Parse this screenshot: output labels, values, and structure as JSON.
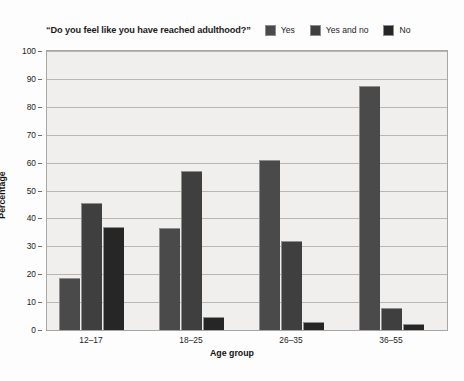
{
  "chart_data": {
    "type": "bar",
    "title": "“Do you feel like you have reached adulthood?”",
    "xlabel": "Age group",
    "ylabel": "Percentage",
    "categories": [
      "12–17",
      "18–25",
      "26–35",
      "36–55"
    ],
    "series": [
      {
        "name": "Yes",
        "values": [
          18.5,
          36.5,
          61,
          87.5
        ],
        "color": "#4a4a4a"
      },
      {
        "name": "Yes and no",
        "values": [
          45.5,
          57,
          32,
          8
        ],
        "color": "#3f3f3f"
      },
      {
        "name": "No",
        "values": [
          37,
          4.5,
          3,
          2
        ],
        "color": "#262626"
      }
    ],
    "ylim": [
      0,
      100
    ],
    "ytick_step": 10,
    "yticks": [
      "100",
      "90",
      "80",
      "70",
      "60",
      "50",
      "40",
      "30",
      "20",
      "10",
      "0"
    ],
    "grid": true,
    "legend_position": "top-right",
    "plot_background": "#f1efed",
    "gridline_color": "#b9b7b5"
  }
}
